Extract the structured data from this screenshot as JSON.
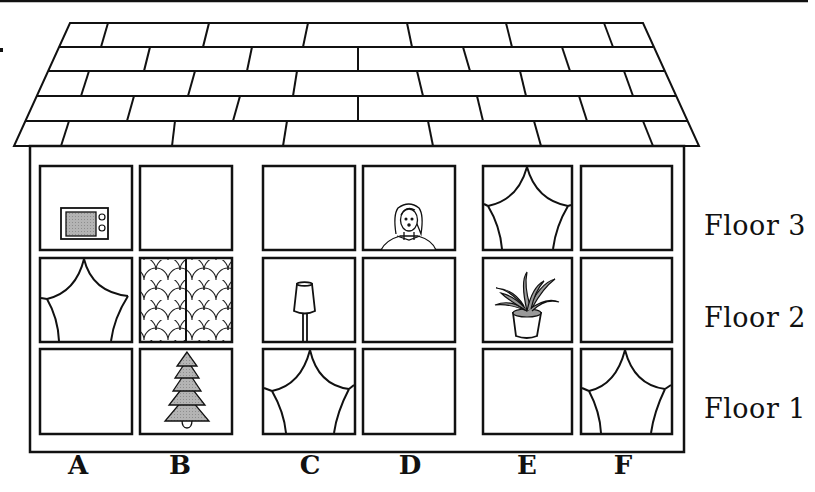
{
  "floors": [
    {
      "label": "Floor 3"
    },
    {
      "label": "Floor 2"
    },
    {
      "label": "Floor 1"
    }
  ],
  "columns": [
    {
      "label": "A"
    },
    {
      "label": "B"
    },
    {
      "label": "C"
    },
    {
      "label": "D"
    },
    {
      "label": "E"
    },
    {
      "label": "F"
    }
  ],
  "windows": [
    {
      "column": "A",
      "floor": 3,
      "content": "microwave"
    },
    {
      "column": "B",
      "floor": 3,
      "content": "empty"
    },
    {
      "column": "C",
      "floor": 3,
      "content": "empty"
    },
    {
      "column": "D",
      "floor": 3,
      "content": "person"
    },
    {
      "column": "E",
      "floor": 3,
      "content": "curtains"
    },
    {
      "column": "F",
      "floor": 3,
      "content": "empty"
    },
    {
      "column": "A",
      "floor": 2,
      "content": "curtains"
    },
    {
      "column": "B",
      "floor": 2,
      "content": "scalloped-pattern"
    },
    {
      "column": "C",
      "floor": 2,
      "content": "lamp"
    },
    {
      "column": "D",
      "floor": 2,
      "content": "empty"
    },
    {
      "column": "E",
      "floor": 2,
      "content": "potted-plant"
    },
    {
      "column": "F",
      "floor": 2,
      "content": "empty"
    },
    {
      "column": "A",
      "floor": 1,
      "content": "empty"
    },
    {
      "column": "B",
      "floor": 1,
      "content": "tree"
    },
    {
      "column": "C",
      "floor": 1,
      "content": "curtains"
    },
    {
      "column": "D",
      "floor": 1,
      "content": "empty"
    },
    {
      "column": "E",
      "floor": 1,
      "content": "empty"
    },
    {
      "column": "F",
      "floor": 1,
      "content": "curtains"
    }
  ],
  "colors": {
    "line": "#111111",
    "fill_gray": "#a8a8a8",
    "background": "#ffffff"
  }
}
